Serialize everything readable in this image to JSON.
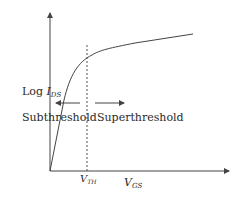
{
  "diagram": {
    "type": "mosfet-iv-curve",
    "y_axis_label": {
      "main": "Log ",
      "var": "I",
      "sub": "DS"
    },
    "x_axis_label": {
      "var": "V",
      "sub": "GS"
    },
    "threshold_label": {
      "var": "V",
      "sub": "TH"
    },
    "regions": {
      "left": "Subthreshold",
      "right": "Superthreshold"
    },
    "colors": {
      "line": "#444444",
      "text": "#2a2a2a"
    }
  }
}
